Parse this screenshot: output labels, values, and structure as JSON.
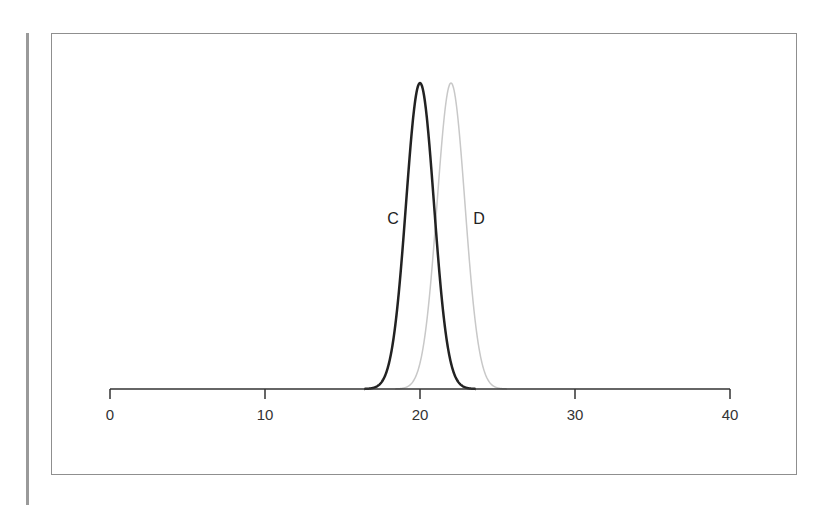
{
  "header": {
    "partial_text": "ᴜᴜ ʀ ʙ ᴄ ᴍ      ᴛ6ᴊ"
  },
  "chart_data": {
    "type": "line",
    "title": "",
    "xlabel": "",
    "ylabel": "",
    "xlim": [
      0,
      40
    ],
    "x_ticks": [
      0,
      10,
      20,
      30,
      40
    ],
    "tick_labels": [
      "0",
      "10",
      "20",
      "30",
      "40"
    ],
    "grid": false,
    "legend": "none (curves labeled directly)",
    "series": [
      {
        "name": "C",
        "shape": "gaussian",
        "mean": 20,
        "sd": 0.9,
        "relative_peak": 1.0,
        "color": "#222222",
        "line_width": 2.5
      },
      {
        "name": "D",
        "shape": "gaussian",
        "mean": 22,
        "sd": 0.9,
        "relative_peak": 1.0,
        "color": "#c8c8c8",
        "line_width": 1.5
      }
    ],
    "annotations": [
      {
        "text": "C",
        "x": 18.5,
        "position": "left of curve C"
      },
      {
        "text": "D",
        "x": 23.7,
        "position": "right of curve D"
      }
    ]
  },
  "labels": {
    "c": "C",
    "d": "D",
    "t0": "0",
    "t10": "10",
    "t20": "20",
    "t30": "30",
    "t40": "40"
  }
}
